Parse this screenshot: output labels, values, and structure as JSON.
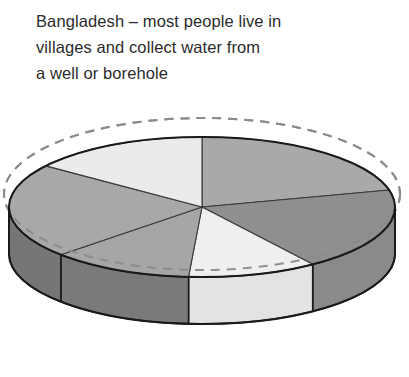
{
  "caption": {
    "text": "Bangladesh – most people live in\nvillages and collect water from\na well or borehole",
    "color": "#2b2b2b"
  },
  "chart_data": {
    "type": "pie",
    "title": "Bangladesh – most people live in villages and collect water from a well or borehole",
    "subtitle": "",
    "xlabel": "",
    "ylabel": "",
    "style": "3d-cylinder-grayscale",
    "legend": "none",
    "grid": false,
    "labels_shown": false,
    "center": {
      "x": 202,
      "y": 107
    },
    "radius_x": 193,
    "radius_y": 70,
    "depth": 47,
    "guide_ellipse": {
      "name": "dashed-reference-ellipse",
      "offset_y": -13,
      "radius_x": 198,
      "radius_y": 76,
      "dash": "9 7",
      "color": "#8a8a8a"
    },
    "categories": [
      "Slice 1",
      "Slice 2",
      "Slice 3",
      "Slice 4",
      "Slice 5",
      "Slice 6"
    ],
    "values": [
      21,
      19,
      11,
      12,
      22,
      15
    ],
    "start_angle_deg": -90,
    "angles_deg": [
      {
        "name": "Slice 1",
        "start": -90,
        "end": -14
      },
      {
        "name": "Slice 2",
        "start": -14,
        "end": 55
      },
      {
        "name": "Slice 3",
        "start": 55,
        "end": 94
      },
      {
        "name": "Slice 4",
        "start": 94,
        "end": 137
      },
      {
        "name": "Slice 5",
        "start": 137,
        "end": 216
      },
      {
        "name": "Slice 6",
        "start": 216,
        "end": 270
      }
    ],
    "colors": {
      "top": [
        "#a9a9a9",
        "#8f8f8f",
        "#efefef",
        "#a6a6a6",
        "#a8a8a8",
        "#ebebeb"
      ],
      "side": [
        "#a0a0a0",
        "#8a8a8a",
        "#e3e3e3",
        "#7a7a7a",
        "#767676",
        "#767676"
      ],
      "outline": "#1a1a1a",
      "divider": "#3a3a3a",
      "background": "#ffffff"
    }
  }
}
